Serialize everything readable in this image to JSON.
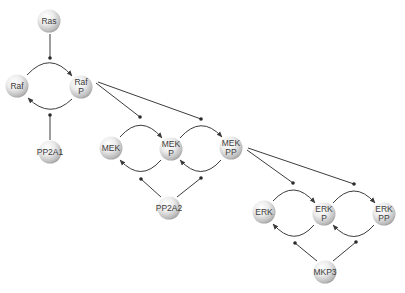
{
  "diagram": {
    "nodes": [
      {
        "id": "ras",
        "lines": [
          "Ras"
        ],
        "x": 49,
        "y": 21
      },
      {
        "id": "raf",
        "lines": [
          "Raf"
        ],
        "x": 17,
        "y": 86
      },
      {
        "id": "rafp",
        "lines": [
          "Raf",
          "P"
        ],
        "x": 81,
        "y": 87
      },
      {
        "id": "pp2a1",
        "lines": [
          "PP2A1"
        ],
        "x": 50,
        "y": 152
      },
      {
        "id": "mek",
        "lines": [
          "MEK"
        ],
        "x": 111,
        "y": 148
      },
      {
        "id": "mekp",
        "lines": [
          "MEK",
          "P"
        ],
        "x": 171,
        "y": 149
      },
      {
        "id": "mekpp",
        "lines": [
          "MEK",
          "PP"
        ],
        "x": 231,
        "y": 148
      },
      {
        "id": "pp2a2",
        "lines": [
          "PP2A2"
        ],
        "x": 169,
        "y": 208
      },
      {
        "id": "erk",
        "lines": [
          "ERK"
        ],
        "x": 264,
        "y": 212
      },
      {
        "id": "erkp",
        "lines": [
          "ERK",
          "P"
        ],
        "x": 324,
        "y": 214
      },
      {
        "id": "erkpp",
        "lines": [
          "ERK",
          "PP"
        ],
        "x": 384,
        "y": 214
      },
      {
        "id": "mkp3",
        "lines": [
          "MKP3"
        ],
        "x": 325,
        "y": 272
      }
    ],
    "labels": {
      "ras": "Ras",
      "raf": "Raf",
      "rafp_1": "Raf",
      "rafp_2": "P",
      "pp2a1": "PP2A1",
      "mek": "MEK",
      "mekp_1": "MEK",
      "mekp_2": "P",
      "mekpp_1": "MEK",
      "mekpp_2": "PP",
      "pp2a2": "PP2A2",
      "erk": "ERK",
      "erkp_1": "ERK",
      "erkp_2": "P",
      "erkpp_1": "ERK",
      "erkpp_2": "PP",
      "mkp3": "MKP3"
    },
    "reactions": [
      {
        "from": "raf",
        "to": "rafp",
        "type": "phosphorylation",
        "catalyst": "ras"
      },
      {
        "from": "rafp",
        "to": "raf",
        "type": "dephosphorylation",
        "catalyst": "pp2a1"
      },
      {
        "from": "mek",
        "to": "mekp",
        "type": "phosphorylation",
        "catalyst": "rafp"
      },
      {
        "from": "mekp",
        "to": "mekpp",
        "type": "phosphorylation",
        "catalyst": "rafp"
      },
      {
        "from": "mekp",
        "to": "mek",
        "type": "dephosphorylation",
        "catalyst": "pp2a2"
      },
      {
        "from": "mekpp",
        "to": "mekp",
        "type": "dephosphorylation",
        "catalyst": "pp2a2"
      },
      {
        "from": "erk",
        "to": "erkp",
        "type": "phosphorylation",
        "catalyst": "mekpp"
      },
      {
        "from": "erkp",
        "to": "erkpp",
        "type": "phosphorylation",
        "catalyst": "mekpp"
      },
      {
        "from": "erkp",
        "to": "erk",
        "type": "dephosphorylation",
        "catalyst": "mkp3"
      },
      {
        "from": "erkpp",
        "to": "erkp",
        "type": "dephosphorylation",
        "catalyst": "mkp3"
      }
    ],
    "colors": {
      "edge": "#3c3c3c",
      "sphere_highlight": "#ffffff",
      "sphere_mid": "#e6e6e6",
      "sphere_shadow": "#a8a8a8",
      "label": "#3a3a3a"
    }
  }
}
